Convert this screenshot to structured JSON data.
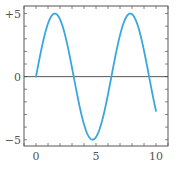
{
  "chart_data": {
    "type": "line",
    "title": "",
    "xlabel": "",
    "ylabel": "",
    "xlim": [
      -1,
      11
    ],
    "ylim": [
      -5.5,
      5.6
    ],
    "grid": false,
    "legend": null,
    "x_ticks": [
      0,
      5,
      10
    ],
    "x_tick_labels": [
      "0",
      "5",
      "10"
    ],
    "x_minor_ticks_step": 1,
    "y_ticks": [
      5,
      0,
      -5
    ],
    "y_tick_labels": [
      "+5",
      "0",
      "−5"
    ],
    "y_minor_ticks_step": 1,
    "reference_lines": [
      {
        "axis": "y",
        "value": 0
      }
    ],
    "series": [
      {
        "name": "y = 5 sin(x)",
        "function": "5*sin(x)",
        "color": "#3aa6de",
        "x": [
          0,
          0.5,
          1,
          1.5,
          2,
          2.5,
          3,
          3.5,
          4,
          4.5,
          5,
          5.5,
          6,
          6.5,
          7,
          7.5,
          8,
          8.5,
          9,
          9.5,
          10
        ],
        "y": [
          0,
          2.4,
          4.21,
          4.99,
          4.55,
          2.99,
          0.71,
          -1.75,
          -3.78,
          -4.89,
          -4.79,
          -3.53,
          -1.4,
          1.08,
          3.28,
          4.69,
          4.95,
          3.99,
          2.06,
          -0.38,
          -2.72
        ]
      }
    ]
  }
}
